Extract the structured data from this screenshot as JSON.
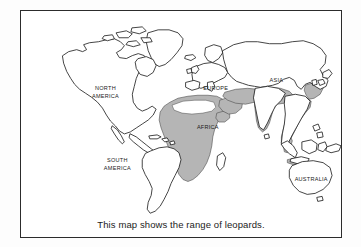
{
  "figure": {
    "caption": "This map shows the range of leopards.",
    "frame_color": "#2c2c2c",
    "background_color": "#ffffff"
  },
  "map": {
    "title": "World map showing leopard range",
    "coastline_color": "#232323",
    "land_fill": "#ffffff",
    "range_fill": "#b5b5b5",
    "range_legend": "shaded area = range of leopards",
    "labels": [
      {
        "name": "north-america",
        "text": "NORTH",
        "x": 85,
        "y": 78
      },
      {
        "name": "north-america-2",
        "text": "AMERICA",
        "x": 85,
        "y": 86
      },
      {
        "name": "south-america",
        "text": "SOUTH",
        "x": 97,
        "y": 151
      },
      {
        "name": "south-america-2",
        "text": "AMERICA",
        "x": 97,
        "y": 159
      },
      {
        "name": "europe",
        "text": "EUROPE",
        "x": 196,
        "y": 78
      },
      {
        "name": "asia",
        "text": "ASIA",
        "x": 257,
        "y": 70
      },
      {
        "name": "africa",
        "text": "AFRICA",
        "x": 188,
        "y": 118
      },
      {
        "name": "australia",
        "text": "AUSTRALIA",
        "x": 296,
        "y": 172
      }
    ],
    "range_regions": [
      "africa-sub-saharan",
      "africa-north-coastal",
      "arabia",
      "middle-east-persia",
      "indian-subcontinent",
      "southeast-asia",
      "java",
      "eastern-china-korea"
    ]
  }
}
